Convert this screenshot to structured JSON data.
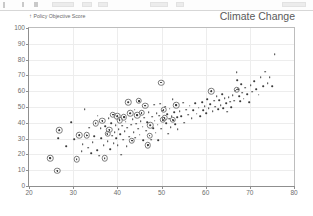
{
  "toolbar": {
    "present": true
  },
  "chart_data": {
    "type": "scatter",
    "title": "Climate Change",
    "ylabel": "Policy Objective Score",
    "ylabel_arrow": "↑",
    "xlabel": "",
    "xlim": [
      20,
      80
    ],
    "ylim": [
      0,
      100
    ],
    "xticks": [
      20,
      30,
      40,
      50,
      60,
      70,
      80
    ],
    "yticks": [
      0,
      10,
      20,
      30,
      40,
      50,
      60,
      70,
      80,
      90,
      100
    ],
    "grid": true,
    "legend": "none",
    "point_color": "#3a3a3a",
    "highlight_color": "#7a7a7a",
    "points": [
      [
        24.8,
        17.6
      ],
      [
        26.4,
        9.6
      ],
      [
        26.6,
        30.2
      ],
      [
        26.9,
        35.4
      ],
      [
        28.4,
        25.1
      ],
      [
        29.6,
        40.3
      ],
      [
        30.3,
        29.6
      ],
      [
        30.8,
        16.8
      ],
      [
        31.4,
        32.2
      ],
      [
        31.9,
        22.0
      ],
      [
        32.2,
        26.4
      ],
      [
        32.6,
        48.6
      ],
      [
        33.1,
        32.1
      ],
      [
        33.4,
        24.2
      ],
      [
        33.6,
        36.8
      ],
      [
        34.1,
        20.6
      ],
      [
        34.4,
        27.9
      ],
      [
        34.8,
        31.5
      ],
      [
        35.1,
        39.6
      ],
      [
        35.4,
        22.5
      ],
      [
        35.6,
        44.6
      ],
      [
        35.9,
        19.1
      ],
      [
        36.2,
        36.4
      ],
      [
        36.4,
        30.3
      ],
      [
        36.6,
        41.2
      ],
      [
        36.9,
        25.7
      ],
      [
        37.1,
        17.5
      ],
      [
        37.3,
        37.8
      ],
      [
        37.6,
        33.0
      ],
      [
        37.8,
        28.4
      ],
      [
        38.0,
        42.9
      ],
      [
        38.2,
        35.6
      ],
      [
        38.4,
        23.4
      ],
      [
        38.6,
        39.9
      ],
      [
        38.8,
        31.8
      ],
      [
        39.0,
        45.1
      ],
      [
        39.2,
        27.2
      ],
      [
        39.4,
        34.2
      ],
      [
        39.6,
        38.6
      ],
      [
        39.8,
        30.1
      ],
      [
        40.0,
        44.2
      ],
      [
        40.1,
        26.0
      ],
      [
        40.3,
        36.1
      ],
      [
        40.5,
        41.7
      ],
      [
        40.7,
        32.9
      ],
      [
        40.9,
        19.8
      ],
      [
        41.1,
        38.2
      ],
      [
        41.3,
        29.3
      ],
      [
        41.5,
        43.6
      ],
      [
        41.7,
        34.8
      ],
      [
        41.9,
        40.6
      ],
      [
        42.1,
        25.2
      ],
      [
        42.3,
        36.9
      ],
      [
        42.5,
        53.0
      ],
      [
        42.7,
        31.2
      ],
      [
        42.9,
        45.9
      ],
      [
        43.1,
        38.8
      ],
      [
        43.3,
        28.7
      ],
      [
        43.5,
        42.1
      ],
      [
        43.7,
        34.0
      ],
      [
        43.9,
        48.2
      ],
      [
        44.1,
        30.6
      ],
      [
        44.3,
        39.4
      ],
      [
        44.5,
        44.8
      ],
      [
        44.7,
        36.2
      ],
      [
        44.9,
        53.8
      ],
      [
        45.1,
        32.4
      ],
      [
        45.3,
        41.0
      ],
      [
        45.5,
        46.3
      ],
      [
        45.7,
        37.5
      ],
      [
        45.9,
        28.9
      ],
      [
        46.1,
        43.2
      ],
      [
        46.3,
        50.8
      ],
      [
        46.5,
        35.1
      ],
      [
        46.7,
        40.4
      ],
      [
        46.9,
        25.8
      ],
      [
        47.1,
        46.8
      ],
      [
        47.3,
        31.9
      ],
      [
        47.5,
        38.3
      ],
      [
        47.7,
        29.4
      ],
      [
        47.9,
        43.9
      ],
      [
        48.1,
        36.6
      ],
      [
        48.3,
        51.4
      ],
      [
        48.5,
        41.3
      ],
      [
        48.7,
        33.7
      ],
      [
        48.9,
        46.1
      ],
      [
        49.1,
        38.9
      ],
      [
        49.3,
        29.1
      ],
      [
        49.5,
        44.4
      ],
      [
        49.7,
        52.1
      ],
      [
        49.9,
        36.3
      ],
      [
        50.1,
        47.6
      ],
      [
        50.3,
        41.9
      ],
      [
        50.5,
        48.2
      ],
      [
        50.7,
        43.1
      ],
      [
        50.9,
        50.3
      ],
      [
        51.1,
        39.7
      ],
      [
        51.3,
        45.5
      ],
      [
        51.5,
        33.2
      ],
      [
        51.7,
        42.6
      ],
      [
        51.9,
        49.0
      ],
      [
        52.1,
        37.1
      ],
      [
        52.3,
        44.0
      ],
      [
        52.5,
        54.8
      ],
      [
        52.7,
        41.8
      ],
      [
        52.9,
        46.6
      ],
      [
        53.1,
        39.2
      ],
      [
        53.3,
        51.2
      ],
      [
        53.5,
        43.4
      ],
      [
        53.7,
        35.9
      ],
      [
        54.1,
        47.2
      ],
      [
        54.5,
        44.3
      ],
      [
        54.9,
        52.7
      ],
      [
        55.2,
        40.1
      ],
      [
        55.6,
        48.4
      ],
      [
        56.0,
        45.2
      ],
      [
        56.4,
        50.9
      ],
      [
        56.8,
        43.0
      ],
      [
        57.2,
        47.9
      ],
      [
        57.6,
        52.3
      ],
      [
        58.0,
        45.8
      ],
      [
        58.4,
        49.6
      ],
      [
        58.8,
        44.1
      ],
      [
        59.2,
        53.1
      ],
      [
        59.5,
        48.0
      ],
      [
        59.8,
        50.4
      ],
      [
        60.1,
        46.2
      ],
      [
        60.4,
        55.1
      ],
      [
        60.7,
        49.1
      ],
      [
        61.0,
        51.6
      ],
      [
        61.3,
        60.0
      ],
      [
        61.6,
        47.4
      ],
      [
        61.9,
        53.9
      ],
      [
        62.2,
        50.2
      ],
      [
        62.5,
        56.8
      ],
      [
        62.8,
        48.7
      ],
      [
        63.1,
        54.3
      ],
      [
        63.4,
        51.0
      ],
      [
        63.7,
        58.2
      ],
      [
        64.0,
        49.4
      ],
      [
        64.3,
        55.6
      ],
      [
        64.6,
        52.4
      ],
      [
        64.9,
        47.1
      ],
      [
        65.2,
        56.1
      ],
      [
        65.5,
        53.3
      ],
      [
        65.8,
        50.0
      ],
      [
        66.1,
        57.4
      ],
      [
        66.4,
        54.1
      ],
      [
        66.7,
        60.3
      ],
      [
        67.0,
        72.0
      ],
      [
        67.2,
        66.8
      ],
      [
        67.4,
        61.2
      ],
      [
        67.6,
        57.0
      ],
      [
        67.8,
        53.6
      ],
      [
        68.0,
        64.4
      ],
      [
        68.3,
        59.1
      ],
      [
        68.6,
        55.3
      ],
      [
        69.0,
        62.1
      ],
      [
        69.4,
        58.0
      ],
      [
        69.8,
        53.2
      ],
      [
        70.2,
        63.8
      ],
      [
        70.6,
        59.8
      ],
      [
        71.0,
        66.2
      ],
      [
        71.5,
        61.4
      ],
      [
        72.0,
        57.8
      ],
      [
        72.5,
        68.7
      ],
      [
        73.0,
        63.1
      ],
      [
        73.5,
        72.3
      ],
      [
        74.0,
        65.0
      ],
      [
        74.5,
        69.0
      ],
      [
        75.0,
        63.2
      ],
      [
        75.6,
        83.6
      ]
    ],
    "highlighted_points": [
      [
        24.8,
        17.6
      ],
      [
        26.4,
        9.6
      ],
      [
        26.9,
        35.4
      ],
      [
        30.8,
        16.8
      ],
      [
        31.4,
        32.2
      ],
      [
        33.1,
        32.1
      ],
      [
        35.1,
        39.6
      ],
      [
        36.6,
        41.2
      ],
      [
        37.1,
        17.5
      ],
      [
        37.8,
        33.0
      ],
      [
        38.2,
        35.6
      ],
      [
        39.0,
        45.1
      ],
      [
        40.0,
        44.2
      ],
      [
        40.5,
        41.7
      ],
      [
        41.5,
        43.6
      ],
      [
        42.5,
        53.0
      ],
      [
        42.9,
        45.9
      ],
      [
        43.3,
        28.7
      ],
      [
        44.5,
        44.8
      ],
      [
        44.9,
        53.8
      ],
      [
        45.5,
        46.3
      ],
      [
        46.3,
        50.8
      ],
      [
        46.9,
        25.8
      ],
      [
        47.3,
        31.9
      ],
      [
        47.5,
        38.3
      ],
      [
        49.9,
        65.4
      ],
      [
        50.3,
        41.9
      ],
      [
        50.5,
        48.2
      ],
      [
        50.7,
        43.1
      ],
      [
        52.5,
        42.0
      ],
      [
        53.3,
        51.2
      ],
      [
        61.3,
        60.0
      ],
      [
        67.0,
        61.0
      ]
    ]
  }
}
